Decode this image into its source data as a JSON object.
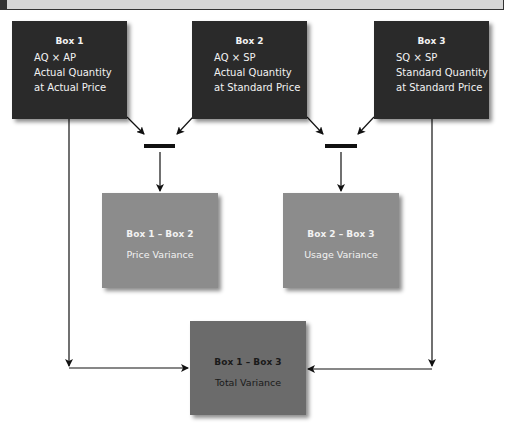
{
  "colors": {
    "top_box": "#2a2a2a",
    "variance_box": "#8c8c8c",
    "total_box": "#6b6b6b",
    "connector": "#111111"
  },
  "boxes": [
    {
      "title": "Box 1",
      "formula": "AQ × AP",
      "line1": "Actual Quantity",
      "line2": "at Actual Price"
    },
    {
      "title": "Box 2",
      "formula": "AQ × SP",
      "line1": "Actual Quantity",
      "line2": "at Standard Price"
    },
    {
      "title": "Box 3",
      "formula": "SQ × SP",
      "line1": "Standard Quantity",
      "line2": "at Standard Price"
    }
  ],
  "variances": [
    {
      "title": "Box 1 – Box 2",
      "label": "Price Variance"
    },
    {
      "title": "Box 2 – Box 3",
      "label": "Usage Variance"
    }
  ],
  "total": {
    "title": "Box 1 – Box 3",
    "label": "Total Variance"
  },
  "operators": [
    "minus-sign",
    "minus-sign"
  ]
}
